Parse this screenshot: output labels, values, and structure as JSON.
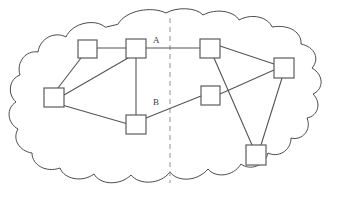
{
  "figure": {
    "canvas": {
      "width": 339,
      "height": 198
    },
    "background_color": "#ffffff"
  },
  "cloud": {
    "name": "cloud-boundary",
    "stroke_color": "#4a4a4a",
    "fill_color": "#ffffff"
  },
  "divider": {
    "name": "partition-divider",
    "style": "dashed",
    "color": "#9a9a9a",
    "x": 170,
    "y_top": 18,
    "y_bottom": 183
  },
  "nodes": [
    {
      "id": "n1",
      "label": "",
      "x": 78,
      "y": 40,
      "w": 19,
      "h": 18,
      "side": "left"
    },
    {
      "id": "n2",
      "label": "",
      "x": 126,
      "y": 39,
      "w": 20,
      "h": 19,
      "side": "left"
    },
    {
      "id": "n3",
      "label": "",
      "x": 44,
      "y": 88,
      "w": 20,
      "h": 19,
      "side": "left"
    },
    {
      "id": "n4",
      "label": "",
      "x": 126,
      "y": 115,
      "w": 20,
      "h": 19,
      "side": "left"
    },
    {
      "id": "n5",
      "label": "",
      "x": 200,
      "y": 39,
      "w": 20,
      "h": 19,
      "side": "right"
    },
    {
      "id": "n6",
      "label": "",
      "x": 274,
      "y": 58,
      "w": 20,
      "h": 20,
      "side": "right"
    },
    {
      "id": "n7",
      "label": "",
      "x": 201,
      "y": 86,
      "w": 19,
      "h": 19,
      "side": "right"
    },
    {
      "id": "n8",
      "label": "",
      "x": 246,
      "y": 145,
      "w": 20,
      "h": 20,
      "side": "right"
    }
  ],
  "edges": [
    {
      "id": "e1",
      "from": "n1",
      "to": "n2",
      "label": "",
      "points": "97,48 126,48"
    },
    {
      "id": "e2",
      "from": "n1",
      "to": "n3",
      "label": "",
      "points": "81,58 58,88"
    },
    {
      "id": "e3",
      "from": "n2",
      "to": "n3",
      "label": "",
      "points": "128,58 64,95"
    },
    {
      "id": "e4",
      "from": "n2",
      "to": "n4",
      "label": "",
      "points": "136,58 136,115"
    },
    {
      "id": "e5",
      "from": "n3",
      "to": "n4",
      "label": "",
      "points": "62,105 128,124"
    },
    {
      "id": "e6",
      "from": "n2",
      "to": "n5",
      "label": "A",
      "points": "146,48 200,48"
    },
    {
      "id": "e7",
      "from": "n4",
      "to": "n7",
      "label": "B",
      "points": "146,118 201,96"
    },
    {
      "id": "e8",
      "from": "n5",
      "to": "n6",
      "label": "",
      "points": "220,46 274,64"
    },
    {
      "id": "e9",
      "from": "n5",
      "to": "n8",
      "label": "",
      "points": "214,58 252,145"
    },
    {
      "id": "e10",
      "from": "n7",
      "to": "n6",
      "label": "",
      "points": "220,94 274,70"
    },
    {
      "id": "e11",
      "from": "n6",
      "to": "n8",
      "label": "",
      "points": "282,78 261,145"
    }
  ],
  "edge_labels": [
    {
      "id": "label-a",
      "text": "A",
      "x": 153,
      "y": 36
    },
    {
      "id": "label-b",
      "text": "B",
      "x": 153,
      "y": 98
    }
  ]
}
